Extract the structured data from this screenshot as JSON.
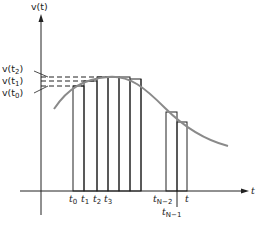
{
  "diagram": {
    "type": "riemann-sum-velocity",
    "y_axis_label": "v(t)",
    "x_axis_label": "t",
    "y_labels": [
      {
        "text": "v(t",
        "sub": "2",
        "close": ")"
      },
      {
        "text": "v(t",
        "sub": "1",
        "close": ")"
      },
      {
        "text": "v(t",
        "sub": "0",
        "close": ")"
      }
    ],
    "x_labels": [
      {
        "text": "t",
        "sub": "0"
      },
      {
        "text": "t",
        "sub": "1"
      },
      {
        "text": "t",
        "sub": "2"
      },
      {
        "text": "t",
        "sub": "3"
      },
      {
        "text": "t",
        "sub": "N−2"
      },
      {
        "text": "t",
        "sub": "N−1"
      },
      {
        "text": "t",
        "sub": ""
      }
    ],
    "colors": {
      "curve": "#8a8a8a",
      "axes": "#222222",
      "bars": "#222222"
    }
  }
}
